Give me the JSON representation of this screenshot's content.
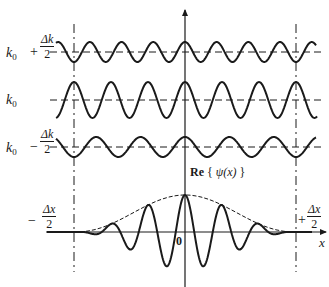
{
  "diagram": {
    "colors": {
      "ink": "#1a1a1a",
      "background": "#ffffff"
    },
    "waves": [
      {
        "id": "k-plus",
        "label_base": "k",
        "label_sub": "0",
        "label_op": "+",
        "frac_num": "Δk",
        "frac_den": "2",
        "baseline_y": 52,
        "amplitude": 10,
        "period": 31.7,
        "phase": "trough at left bound"
      },
      {
        "id": "k-center",
        "label_base": "k",
        "label_sub": "0",
        "baseline_y": 100,
        "amplitude": 18,
        "period": 37,
        "phase": "peak at left bound"
      },
      {
        "id": "k-minus",
        "label_base": "k",
        "label_sub": "0",
        "label_op": "−",
        "frac_num": "Δk",
        "frac_den": "2",
        "baseline_y": 147,
        "amplitude": 10,
        "period": 44.4,
        "phase": "trough at left bound"
      }
    ],
    "packet": {
      "label": "Re",
      "label_open": "{",
      "label_fn": "ψ(x)",
      "label_close": "}",
      "baseline_y": 232,
      "origin_label": "0",
      "x_axis_label": "x",
      "left_bound": {
        "sign": "−",
        "frac_num": "Δx",
        "frac_den": "2"
      },
      "right_bound": {
        "sign": "+",
        "frac_num": "Δx",
        "frac_den": "2"
      }
    },
    "guides": {
      "left_x": 74,
      "center_x": 185,
      "right_x": 296
    }
  }
}
